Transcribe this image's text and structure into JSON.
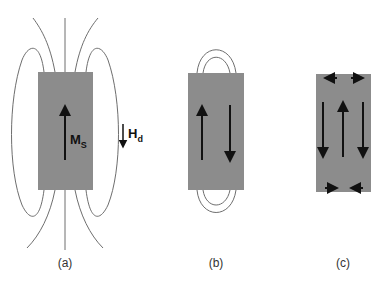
{
  "colors": {
    "domain_fill": "#8c8c8c",
    "field_line": "#6e6e6e",
    "arrow": "#111111",
    "label": "#333333"
  },
  "panels": [
    {
      "id": "a",
      "caption": "(a)",
      "magnetization_label": "M",
      "magnetization_sub": "S",
      "field_label": "H",
      "field_sub": "d",
      "domains": 1
    },
    {
      "id": "b",
      "caption": "(b)",
      "domains": 2
    },
    {
      "id": "c",
      "caption": "(c)",
      "domains": 3,
      "closure_domains": 4
    }
  ]
}
